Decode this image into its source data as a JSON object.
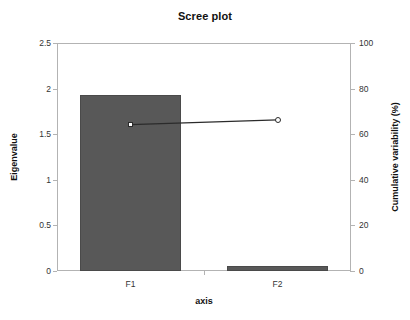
{
  "chart_data": {
    "type": "bar",
    "title": "Scree plot",
    "xlabel": "axis",
    "ylabel": "Eigenvalue",
    "y2label": "Cumulative variability (%)",
    "categories": [
      "F1",
      "F2"
    ],
    "values": [
      1.93,
      0.06
    ],
    "ylim": [
      0,
      2.5
    ],
    "y2lim": [
      0,
      100
    ],
    "yticks": [
      "0",
      "0.5",
      "1",
      "1.5",
      "2",
      "2.5"
    ],
    "ytick_values": [
      0,
      0.5,
      1,
      1.5,
      2,
      2.5
    ],
    "y2ticks": [
      "0",
      "20",
      "40",
      "60",
      "80",
      "100"
    ],
    "y2tick_values": [
      0,
      20,
      40,
      60,
      80,
      100
    ],
    "grid": false,
    "legend": "none",
    "bar_color": "#585858",
    "line_color": "#2b2b2b",
    "series": [
      {
        "name": "Eigenvalue",
        "type": "bar",
        "axis": "left",
        "values": [
          1.93,
          0.06
        ]
      },
      {
        "name": "Cumulative variability (%)",
        "type": "line",
        "axis": "right",
        "values": [
          64.2,
          66.3
        ],
        "markers": [
          "square",
          "circle"
        ]
      }
    ]
  }
}
